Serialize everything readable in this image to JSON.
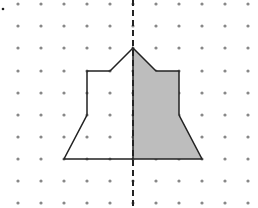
{
  "diagram": {
    "type": "dot-grid symmetry figure",
    "grid": {
      "columns_x": [
        18,
        41,
        64,
        87,
        110,
        133,
        156,
        179,
        202,
        225,
        248
      ],
      "rows_y": [
        4,
        26,
        48,
        71,
        93,
        115,
        137,
        159,
        181,
        203
      ],
      "dot_color": "#888888",
      "dot_radius": 1.6
    },
    "marker_dot": {
      "x": 3,
      "y": 9,
      "color": "#222222",
      "r": 1.3
    },
    "mirror_line": {
      "x": 133,
      "y1": 0,
      "y2": 208,
      "dash": "6,4",
      "color": "#222222"
    },
    "left_half_outline": {
      "points": [
        [
          133,
          48
        ],
        [
          110,
          71
        ],
        [
          87,
          71
        ],
        [
          87,
          115
        ],
        [
          64,
          159
        ],
        [
          133,
          159
        ]
      ],
      "fill": "none",
      "stroke": "#222222"
    },
    "right_half_shaded": {
      "points": [
        [
          133,
          48
        ],
        [
          156,
          71
        ],
        [
          179,
          71
        ],
        [
          179,
          115
        ],
        [
          202,
          159
        ],
        [
          133,
          159
        ]
      ],
      "fill": "#bdbdbd",
      "stroke": "#222222"
    }
  }
}
